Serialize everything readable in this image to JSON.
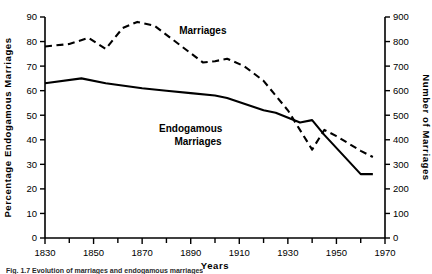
{
  "chart_data": {
    "type": "line",
    "title": "",
    "xlabel": "Years",
    "ylabel": "Percentage Endogamous Marriages",
    "y2label": "Number of Marriages",
    "xlim": [
      1830,
      1970
    ],
    "ylim": [
      0,
      90
    ],
    "y2lim": [
      0,
      900
    ],
    "grid": false,
    "legend_position": "inline-annotations",
    "x_tick_labels": [
      "1830",
      "1850",
      "1870",
      "1890",
      "1910",
      "1930",
      "1950",
      "1970"
    ],
    "x_tick_values": [
      1830,
      1850,
      1870,
      1890,
      1910,
      1930,
      1950,
      1970
    ],
    "x_minor_tick_values": [
      1840,
      1860,
      1880,
      1900,
      1920,
      1940,
      1960
    ],
    "y_tick_labels": [
      "0",
      "10",
      "20",
      "30",
      "40",
      "50",
      "60",
      "70",
      "80",
      "90"
    ],
    "y_tick_values": [
      0,
      10,
      20,
      30,
      40,
      50,
      60,
      70,
      80,
      90
    ],
    "y2_tick_labels": [
      "0",
      "100",
      "200",
      "300",
      "400",
      "500",
      "600",
      "700",
      "800",
      "900"
    ],
    "y2_tick_values": [
      0,
      100,
      200,
      300,
      400,
      500,
      600,
      700,
      800,
      900
    ],
    "annotations": [
      {
        "text": "Marriages",
        "x": 1895,
        "y_axis": "right",
        "y": 830
      },
      {
        "text": "Endogamous",
        "x": 1890,
        "y_axis": "left",
        "y": 43
      },
      {
        "text": "Marriages",
        "x": 1893,
        "y_axis": "left",
        "y": 38
      }
    ],
    "series": [
      {
        "name": "Endogamous Marriages",
        "axis": "left",
        "style": "solid",
        "color": "#000000",
        "units": "percent",
        "x": [
          1830,
          1845,
          1855,
          1870,
          1880,
          1890,
          1900,
          1905,
          1920,
          1925,
          1935,
          1940,
          1945,
          1960,
          1965
        ],
        "values": [
          63,
          65,
          63,
          61,
          60,
          59,
          58,
          57,
          52,
          51,
          47,
          48,
          42,
          26,
          26
        ]
      },
      {
        "name": "Marriages",
        "axis": "right",
        "style": "dashed",
        "color": "#000000",
        "units": "count",
        "x": [
          1830,
          1840,
          1848,
          1855,
          1862,
          1868,
          1875,
          1885,
          1895,
          1900,
          1905,
          1912,
          1920,
          1930,
          1940,
          1945,
          1950,
          1960,
          1965
        ],
        "values": [
          780,
          790,
          815,
          770,
          855,
          880,
          865,
          790,
          715,
          720,
          730,
          700,
          640,
          520,
          360,
          440,
          415,
          355,
          330
        ]
      }
    ]
  },
  "caption": {
    "text": "Fig. 1.7   Evolution of marriages and endogamous marriages"
  }
}
